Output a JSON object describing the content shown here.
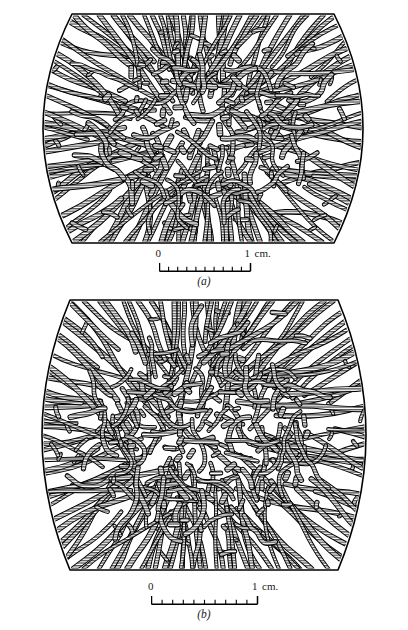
{
  "figure": {
    "kind": "ingot-macrostructure-cross-sections",
    "background_color": "#ffffff",
    "ink_color": "#000000",
    "hatch_color": "#3a3a3a",
    "panels": [
      {
        "id": "a",
        "label": "(a)",
        "outline": {
          "shape": "barrel",
          "flat_top": true,
          "flat_bottom": true,
          "bulged_sides": true,
          "left_px": 14,
          "right_px": 392,
          "top_px": 14,
          "bottom_px": 243,
          "top_inset_px": 58,
          "bottom_inset_px": 58
        },
        "structure": {
          "outer_zone": "columnar dendrites radiating inward from chill surface",
          "inner_zone": "equiaxed dendritic grains",
          "fill": "black outline with horizontal line hatching"
        },
        "scalebar": {
          "zero_label": "0",
          "one_label": "1",
          "unit_label": "cm.",
          "divisions": 10,
          "length_px": 91,
          "start_px": 152,
          "end_px": 243
        }
      },
      {
        "id": "b",
        "label": "(b)",
        "outline": {
          "shape": "barrel",
          "flat_top": true,
          "flat_bottom": true,
          "bulged_sides": true,
          "left_px": 14,
          "right_px": 394,
          "top_px": 300,
          "bottom_px": 570,
          "top_inset_px": 56,
          "bottom_inset_px": 56
        },
        "structure": {
          "outer_zone": "columnar dendrites radiating inward from chill surface",
          "inner_zone": "equiaxed dendritic grains",
          "fill": "black outline with horizontal line hatching"
        },
        "scalebar": {
          "zero_label": "0",
          "one_label": "1",
          "unit_label": "cm.",
          "divisions": 10,
          "length_px": 106,
          "start_px": 152,
          "end_px": 258
        }
      }
    ]
  }
}
